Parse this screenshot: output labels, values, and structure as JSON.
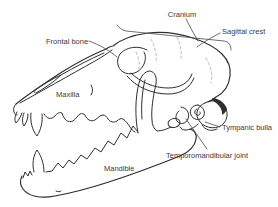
{
  "diagram": {
    "labels": {
      "cranium": "Cranium",
      "sagittal_crest": "Sagittal crest",
      "frontal_bone": "Frontal bone",
      "maxilla": "Maxilla",
      "tympanic_bulla": "Tympanic bulla",
      "temporomandibular_joint": "Temporomandibular joint",
      "mandible": "Mandible"
    },
    "colors": {
      "background": "#ffffff",
      "line_art": "#2f2f2f",
      "label_text": "#3a3a3a",
      "leader_line": "#4a4a4a",
      "suture_dash": "#b5b5b5"
    }
  }
}
